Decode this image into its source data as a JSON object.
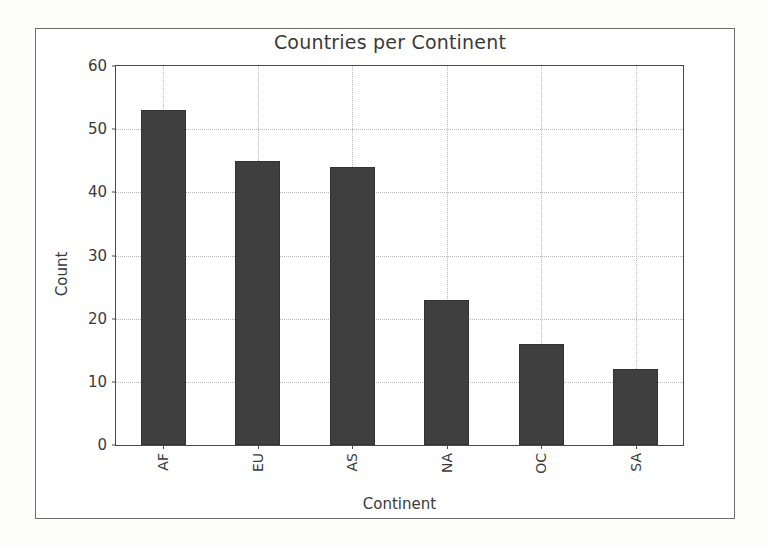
{
  "chart_data": {
    "type": "bar",
    "title": "Countries per Continent",
    "xlabel": "Continent",
    "ylabel": "Count",
    "categories": [
      "AF",
      "EU",
      "AS",
      "NA",
      "OC",
      "SA"
    ],
    "values": [
      53,
      45,
      44,
      23,
      16,
      12
    ],
    "ylim": [
      0,
      60
    ],
    "yticks": [
      0,
      10,
      20,
      30,
      40,
      50,
      60
    ],
    "ytick_labels": [
      "0",
      "10",
      "20",
      "30",
      "40",
      "50",
      "60"
    ],
    "xtick_rotation": 90,
    "grid": true,
    "grid_style": "dotted",
    "legend": null,
    "bar_color": "#3f3f3f",
    "grid_color": "#b9b9b9",
    "axis_color": "#4a4a4a",
    "text_color": "#3a3a3a",
    "background_color": "#ffffff"
  },
  "figure": {
    "frame_color": "#6e6e6e",
    "canvas_color": "#ffffff"
  }
}
